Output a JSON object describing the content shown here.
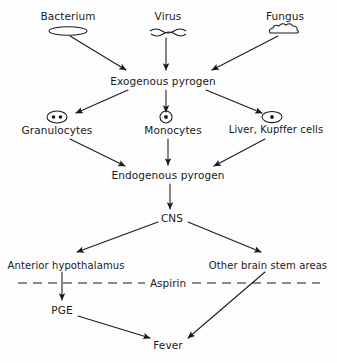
{
  "diagram": {
    "type": "flowchart",
    "background_color": "#fdfdfd",
    "stroke_color": "#1a1a1a",
    "nodes": [
      {
        "id": "bacterium",
        "label": "Bacterium",
        "icon": "bacterium-rod-icon",
        "x": 68,
        "y": 16
      },
      {
        "id": "virus",
        "label": "Virus",
        "icon": "virus-squiggle-icon",
        "x": 168,
        "y": 16
      },
      {
        "id": "fungus",
        "label": "Fungus",
        "icon": "fungus-cloud-icon",
        "x": 285,
        "y": 16
      },
      {
        "id": "exogenous_pyrogen",
        "label": "Exogenous pyrogen",
        "icon": "",
        "x": 163,
        "y": 81
      },
      {
        "id": "granulocytes",
        "label": "Granulocytes",
        "icon": "granulocyte-cell-icon",
        "x": 57,
        "y": 130
      },
      {
        "id": "monocytes",
        "label": "Monocytes",
        "icon": "monocyte-cell-icon",
        "x": 173,
        "y": 130
      },
      {
        "id": "liver_kupffer",
        "label": "Liver, Kupffer cells",
        "icon": "kupffer-cell-icon",
        "x": 276,
        "y": 130
      },
      {
        "id": "endogenous_pyrogen",
        "label": "Endogenous pyrogen",
        "icon": "",
        "x": 168,
        "y": 175
      },
      {
        "id": "cns",
        "label": "CNS",
        "icon": "",
        "x": 172,
        "y": 218
      },
      {
        "id": "anterior_hypothalamus",
        "label": "Anterior hypothalamus",
        "icon": "",
        "x": 66,
        "y": 266
      },
      {
        "id": "other_brain_stem",
        "label": "Other brain stem areas",
        "icon": "",
        "x": 268,
        "y": 266
      },
      {
        "id": "pge",
        "label": "PGE",
        "icon": "",
        "x": 62,
        "y": 310
      },
      {
        "id": "fever",
        "label": "Fever",
        "icon": "",
        "x": 168,
        "y": 345
      }
    ],
    "inhibitor": {
      "label": "Aspirin",
      "style": "dashed-line",
      "x": 168,
      "y": 283,
      "line_start_x": 18,
      "line_end_x": 320
    },
    "edges": [
      {
        "from": "bacterium",
        "to": "exogenous_pyrogen"
      },
      {
        "from": "virus",
        "to": "exogenous_pyrogen"
      },
      {
        "from": "fungus",
        "to": "exogenous_pyrogen"
      },
      {
        "from": "exogenous_pyrogen",
        "to": "granulocytes"
      },
      {
        "from": "exogenous_pyrogen",
        "to": "monocytes"
      },
      {
        "from": "exogenous_pyrogen",
        "to": "liver_kupffer"
      },
      {
        "from": "granulocytes",
        "to": "endogenous_pyrogen"
      },
      {
        "from": "monocytes",
        "to": "endogenous_pyrogen"
      },
      {
        "from": "liver_kupffer",
        "to": "endogenous_pyrogen"
      },
      {
        "from": "endogenous_pyrogen",
        "to": "cns"
      },
      {
        "from": "cns",
        "to": "anterior_hypothalamus"
      },
      {
        "from": "cns",
        "to": "other_brain_stem"
      },
      {
        "from": "anterior_hypothalamus",
        "to": "pge"
      },
      {
        "from": "pge",
        "to": "fever"
      },
      {
        "from": "other_brain_stem",
        "to": "fever"
      }
    ]
  }
}
